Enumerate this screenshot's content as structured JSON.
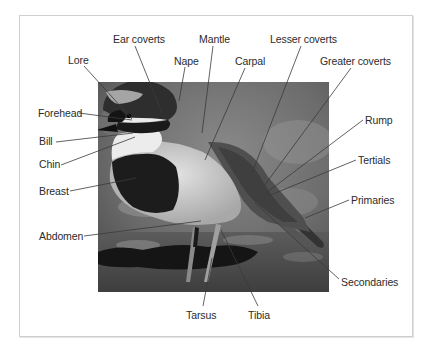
{
  "diagram": {
    "colors": {
      "label_text": "#2b2b2b",
      "leader_line": "#3a3a3a",
      "frame_border": "#cfcfcf"
    },
    "labels": [
      {
        "id": "lore",
        "text": "Lore",
        "x": 68,
        "y": 54,
        "line": [
          84,
          66,
          132,
          119
        ]
      },
      {
        "id": "ear-coverts",
        "text": "Ear coverts",
        "x": 113,
        "y": 33,
        "line": [
          135,
          46,
          162,
          113
        ]
      },
      {
        "id": "nape",
        "text": "Nape",
        "x": 174,
        "y": 55,
        "line": [
          185,
          67,
          179,
          101
        ]
      },
      {
        "id": "mantle",
        "text": "Mantle",
        "x": 199,
        "y": 33,
        "line": [
          213,
          46,
          202,
          133
        ]
      },
      {
        "id": "carpal",
        "text": "Carpal",
        "x": 235,
        "y": 55,
        "line": [
          245,
          68,
          205,
          160
        ]
      },
      {
        "id": "lesser-coverts",
        "text": "Lesser coverts",
        "x": 270,
        "y": 33,
        "line": [
          301,
          46,
          252,
          173
        ]
      },
      {
        "id": "greater-coverts",
        "text": "Greater coverts",
        "x": 320,
        "y": 55,
        "line": [
          351,
          68,
          264,
          186
        ]
      },
      {
        "id": "forehead",
        "text": "Forehead",
        "x": 38,
        "y": 107,
        "line": [
          79,
          113,
          132,
          120
        ]
      },
      {
        "id": "bill",
        "text": "Bill",
        "x": 39,
        "y": 135,
        "line": [
          56,
          142,
          133,
          133
        ]
      },
      {
        "id": "chin",
        "text": "Chin",
        "x": 39,
        "y": 158,
        "line": [
          61,
          165,
          135,
          137
        ]
      },
      {
        "id": "breast",
        "text": "Breast",
        "x": 39,
        "y": 185,
        "line": [
          70,
          191,
          136,
          178
        ]
      },
      {
        "id": "abdomen",
        "text": "Abdomen",
        "x": 39,
        "y": 230,
        "line": [
          84,
          236,
          201,
          221
        ]
      },
      {
        "id": "rump",
        "text": "Rump",
        "x": 365,
        "y": 114,
        "line": [
          363,
          120,
          266,
          193
        ]
      },
      {
        "id": "tertials",
        "text": "Tertials",
        "x": 358,
        "y": 154,
        "line": [
          356,
          160,
          268,
          196
        ]
      },
      {
        "id": "primaries",
        "text": "Primaries",
        "x": 351,
        "y": 194,
        "line": [
          349,
          200,
          305,
          218
        ]
      },
      {
        "id": "secondaries",
        "text": "Secondaries",
        "x": 341,
        "y": 276,
        "line": [
          339,
          279,
          255,
          203
        ]
      },
      {
        "id": "tarsus",
        "text": "Tarsus",
        "x": 186,
        "y": 309,
        "line": [
          203,
          306,
          212,
          258
        ]
      },
      {
        "id": "tibia",
        "text": "Tibia",
        "x": 248,
        "y": 309,
        "line": [
          258,
          306,
          221,
          230
        ]
      }
    ]
  }
}
